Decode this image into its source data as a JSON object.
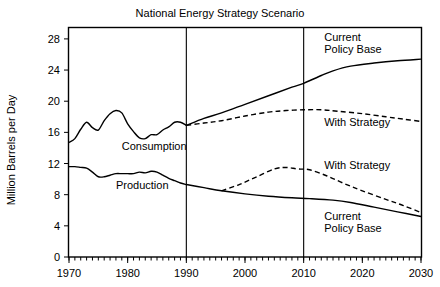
{
  "chart_data": {
    "type": "line",
    "title": "National Energy Strategy Scenario",
    "xlabel": "",
    "ylabel": "Million Barrels per Day",
    "xlim": [
      1970,
      2030
    ],
    "ylim": [
      0,
      29.4
    ],
    "grid": false,
    "legend_position": "inline-annotations",
    "xticks": [
      1970,
      1980,
      1990,
      2000,
      2010,
      2020,
      2030
    ],
    "xtick_labels": [
      "1970",
      "1980",
      "1990",
      "2000",
      "2010",
      "2020",
      "2030"
    ],
    "minor_xtick_interval": 1,
    "yticks": [
      0,
      4,
      8,
      12,
      16,
      20,
      24,
      28
    ],
    "ytick_labels": [
      "0",
      "4",
      "8",
      "12",
      "16",
      "20",
      "24",
      "28"
    ],
    "reference_lines": [
      {
        "x": 1990,
        "label": ""
      },
      {
        "x": 2010,
        "label": ""
      }
    ],
    "annotations": [
      {
        "text": "Consumption",
        "x": 1979.0,
        "y": 14.2
      },
      {
        "text": "Production",
        "x": 1978.0,
        "y": 9.3
      },
      {
        "text": "Current",
        "x": 2013.5,
        "y": 28.2
      },
      {
        "text": "Policy Base",
        "x": 2013.5,
        "y": 26.7
      },
      {
        "text": "With Strategy",
        "x": 2013.5,
        "y": 17.3
      },
      {
        "text": "With Strategy",
        "x": 2013.5,
        "y": 11.8
      },
      {
        "text": "Current",
        "x": 2013.5,
        "y": 5.2
      },
      {
        "text": "Policy Base",
        "x": 2013.5,
        "y": 3.7
      }
    ],
    "series": [
      {
        "name": "Consumption (history)",
        "style": "solid",
        "x": [
          1970,
          1971,
          1972,
          1973,
          1974,
          1975,
          1976,
          1977,
          1978,
          1979,
          1980,
          1981,
          1982,
          1983,
          1984,
          1985,
          1986,
          1987,
          1988,
          1989,
          1990
        ],
        "values": [
          14.7,
          15.2,
          16.4,
          17.3,
          16.6,
          16.3,
          17.5,
          18.4,
          18.8,
          18.5,
          17.1,
          16.1,
          15.3,
          15.2,
          15.7,
          15.7,
          16.3,
          16.7,
          17.3,
          17.3,
          16.9
        ]
      },
      {
        "name": "Consumption — Current Policy Base",
        "style": "solid",
        "x": [
          1990,
          1993,
          1996,
          2000,
          2004,
          2008,
          2010,
          2013,
          2015,
          2018,
          2022,
          2026,
          2030
        ],
        "values": [
          16.9,
          17.8,
          18.5,
          19.6,
          20.7,
          21.8,
          22.3,
          23.3,
          23.9,
          24.5,
          24.9,
          25.2,
          25.4
        ]
      },
      {
        "name": "Consumption — With Strategy",
        "style": "dashed",
        "x": [
          1990,
          1993,
          1996,
          2000,
          2004,
          2007,
          2010,
          2013,
          2016,
          2020,
          2024,
          2027,
          2030
        ],
        "values": [
          16.9,
          17.2,
          17.5,
          18.1,
          18.6,
          18.8,
          18.9,
          18.9,
          18.7,
          18.4,
          18.0,
          17.7,
          17.4
        ]
      },
      {
        "name": "Production (history)",
        "style": "solid",
        "x": [
          1970,
          1971,
          1972,
          1973,
          1974,
          1975,
          1976,
          1977,
          1978,
          1979,
          1980,
          1981,
          1982,
          1983,
          1984,
          1985,
          1986,
          1987,
          1988,
          1989,
          1990
        ],
        "values": [
          11.6,
          11.6,
          11.5,
          11.4,
          10.9,
          10.3,
          10.3,
          10.5,
          10.7,
          10.7,
          10.7,
          10.7,
          10.9,
          10.8,
          11.0,
          10.9,
          10.5,
          10.1,
          9.8,
          9.5,
          9.3
        ]
      },
      {
        "name": "Production — Current Policy Base",
        "style": "solid",
        "x": [
          1990,
          1993,
          1996,
          2000,
          2004,
          2008,
          2011,
          2015,
          2018,
          2022,
          2026,
          2030
        ],
        "values": [
          9.3,
          8.9,
          8.5,
          8.1,
          7.8,
          7.6,
          7.5,
          7.3,
          7.0,
          6.4,
          5.8,
          5.2
        ]
      },
      {
        "name": "Production — With Strategy",
        "style": "dashed",
        "x": [
          1996,
          1999,
          2002,
          2005,
          2007,
          2009,
          2011,
          2014,
          2017,
          2020,
          2024,
          2027,
          2030
        ],
        "values": [
          8.5,
          9.3,
          10.3,
          11.3,
          11.5,
          11.3,
          11.2,
          10.4,
          9.4,
          8.5,
          7.4,
          6.6,
          5.7
        ]
      }
    ]
  }
}
